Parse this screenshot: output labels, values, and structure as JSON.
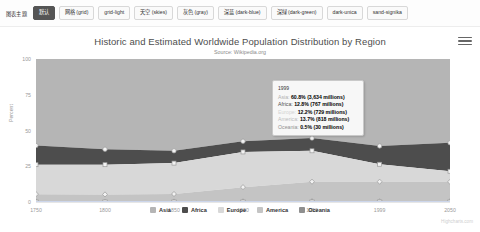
{
  "toolbar": {
    "label": "图表主题",
    "buttons": [
      {
        "label": "默认",
        "active": true
      },
      {
        "label": "网格 (grid)",
        "active": false
      },
      {
        "label": "grid-light",
        "active": false
      },
      {
        "label": "天空 (skies)",
        "active": false
      },
      {
        "label": "灰色 (gray)",
        "active": false
      },
      {
        "label": "深蓝 (dark-blue)",
        "active": false
      },
      {
        "label": "深绿 (dark-green)",
        "active": false
      },
      {
        "label": "dark-unica",
        "active": false
      },
      {
        "label": "sand-signika",
        "active": false
      }
    ]
  },
  "chart": {
    "menu_icon": "hamburger-menu-icon",
    "credit": "Highcharts.com"
  },
  "tooltip": {
    "header": "1999",
    "rows": [
      {
        "name": "Asia: ",
        "value": "60.8% (3,634 millions)",
        "color": "#b0b0b0"
      },
      {
        "name": "Africa: ",
        "value": "12.8% (767 millions)",
        "color": "#4f4f4f"
      },
      {
        "name": "Europe: ",
        "value": "12.2% (729 millions)",
        "color": "#d4d4d4"
      },
      {
        "name": "America: ",
        "value": "13.7% (818 millions)",
        "color": "#bdbdbd"
      },
      {
        "name": "Oceania: ",
        "value": "0.5% (30 millions)",
        "color": "#909090"
      }
    ]
  },
  "chart_data": {
    "type": "area",
    "title": "Historic and Estimated Worldwide Population Distribution by Region",
    "subtitle": "Source: Wikipedia.org",
    "xlabel": "",
    "ylabel": "Percent",
    "categories": [
      "1750",
      "1800",
      "1850",
      "1900",
      "1950",
      "1999",
      "2050"
    ],
    "x": [
      1750,
      1800,
      1850,
      1900,
      1950,
      1999,
      2050
    ],
    "xlim": [
      1750,
      2050
    ],
    "ylim": [
      0,
      100
    ],
    "yticks": [
      0,
      25,
      50,
      75,
      100
    ],
    "grid": true,
    "stacked": "percent",
    "legend_position": "bottom",
    "series": [
      {
        "name": "Asia",
        "color": "#b5b5b5",
        "values": [
          60.5,
          63.1,
          64.2,
          57.5,
          55.3,
          60.8,
          58.6
        ]
      },
      {
        "name": "Africa",
        "color": "#4d4d4d",
        "values": [
          13.4,
          10.8,
          8.6,
          7.5,
          8.9,
          12.8,
          19.9
        ]
      },
      {
        "name": "Europe",
        "color": "#d8d8d8",
        "values": [
          20.6,
          20.8,
          21.6,
          24.6,
          21.6,
          12.2,
          7.4
        ]
      },
      {
        "name": "America",
        "color": "#c4c4c4",
        "values": [
          5.2,
          5.1,
          5.3,
          10.0,
          13.7,
          13.7,
          13.6
        ]
      },
      {
        "name": "Oceania",
        "color": "#8f8f8f",
        "values": [
          0.3,
          0.2,
          0.3,
          0.4,
          0.5,
          0.5,
          0.5
        ]
      }
    ],
    "annotation_point": {
      "x": 1999,
      "label": "1999"
    }
  }
}
